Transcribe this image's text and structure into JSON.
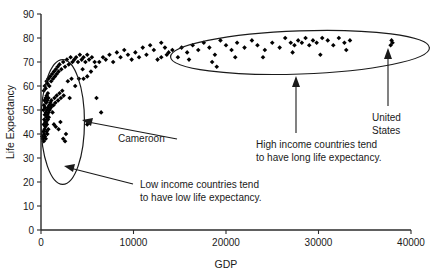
{
  "chart_data": {
    "type": "scatter",
    "title": "",
    "xlabel": "GDP",
    "ylabel": "Life Expectancy",
    "xlim": [
      0,
      40000
    ],
    "ylim": [
      0,
      90
    ],
    "grid": false,
    "legend": "none",
    "x_ticks": [
      "0",
      "10000",
      "20000",
      "30000",
      "40000"
    ],
    "x_tick_values": [
      0,
      10000,
      20000,
      30000,
      40000
    ],
    "y_ticks": [
      "0",
      "10",
      "20",
      "30",
      "40",
      "50",
      "60",
      "70",
      "80",
      "90"
    ],
    "y_tick_values": [
      0,
      10,
      20,
      30,
      40,
      50,
      60,
      70,
      80,
      90
    ],
    "marker_shape": "diamond",
    "marker_color": "#000000",
    "points": [
      [
        150,
        39
      ],
      [
        200,
        38
      ],
      [
        260,
        41
      ],
      [
        300,
        37
      ],
      [
        340,
        40
      ],
      [
        380,
        42
      ],
      [
        420,
        39
      ],
      [
        470,
        43
      ],
      [
        510,
        38
      ],
      [
        560,
        45
      ],
      [
        600,
        41
      ],
      [
        640,
        44
      ],
      [
        690,
        40
      ],
      [
        740,
        46
      ],
      [
        790,
        42
      ],
      [
        840,
        47
      ],
      [
        300,
        44
      ],
      [
        350,
        46
      ],
      [
        410,
        48
      ],
      [
        460,
        45
      ],
      [
        520,
        49
      ],
      [
        580,
        47
      ],
      [
        640,
        50
      ],
      [
        700,
        48
      ],
      [
        760,
        51
      ],
      [
        820,
        49
      ],
      [
        880,
        52
      ],
      [
        940,
        50
      ],
      [
        1000,
        53
      ],
      [
        1060,
        51
      ],
      [
        1120,
        54
      ],
      [
        1180,
        52
      ],
      [
        260,
        50
      ],
      [
        320,
        52
      ],
      [
        380,
        54
      ],
      [
        440,
        51
      ],
      [
        500,
        55
      ],
      [
        560,
        53
      ],
      [
        620,
        56
      ],
      [
        680,
        54
      ],
      [
        740,
        57
      ],
      [
        800,
        55
      ],
      [
        1250,
        49
      ],
      [
        1350,
        52
      ],
      [
        1450,
        55
      ],
      [
        1550,
        53
      ],
      [
        1700,
        56
      ],
      [
        1850,
        54
      ],
      [
        2000,
        57
      ],
      [
        2150,
        55
      ],
      [
        2300,
        58
      ],
      [
        2450,
        56
      ],
      [
        1400,
        44
      ],
      [
        1600,
        43
      ],
      [
        1900,
        42
      ],
      [
        2100,
        45
      ],
      [
        2400,
        38
      ],
      [
        2600,
        37
      ],
      [
        2700,
        40
      ],
      [
        300,
        58
      ],
      [
        400,
        60
      ],
      [
        500,
        59
      ],
      [
        600,
        62
      ],
      [
        700,
        61
      ],
      [
        800,
        63
      ],
      [
        900,
        60
      ],
      [
        1000,
        64
      ],
      [
        1100,
        62
      ],
      [
        1200,
        65
      ],
      [
        1300,
        63
      ],
      [
        1400,
        66
      ],
      [
        1500,
        64
      ],
      [
        1600,
        67
      ],
      [
        1700,
        65
      ],
      [
        1800,
        68
      ],
      [
        1900,
        66
      ],
      [
        2000,
        69
      ],
      [
        2200,
        67
      ],
      [
        2400,
        70
      ],
      [
        2600,
        68
      ],
      [
        2800,
        71
      ],
      [
        3000,
        69
      ],
      [
        3200,
        72
      ],
      [
        3400,
        70
      ],
      [
        3600,
        71
      ],
      [
        3800,
        72
      ],
      [
        4000,
        70
      ],
      [
        4200,
        73
      ],
      [
        4400,
        71
      ],
      [
        4600,
        72
      ],
      [
        4800,
        70
      ],
      [
        5000,
        73
      ],
      [
        5200,
        71
      ],
      [
        5500,
        72
      ],
      [
        5800,
        70
      ],
      [
        2900,
        62
      ],
      [
        3300,
        63
      ],
      [
        3700,
        60
      ],
      [
        4100,
        63
      ],
      [
        4500,
        67
      ],
      [
        5000,
        64
      ],
      [
        5400,
        66
      ],
      [
        5900,
        68
      ],
      [
        6300,
        70
      ],
      [
        6700,
        72
      ],
      [
        7000,
        71
      ],
      [
        7400,
        73
      ],
      [
        7800,
        70
      ],
      [
        8200,
        74
      ],
      [
        8600,
        72
      ],
      [
        9000,
        75
      ],
      [
        9400,
        73
      ],
      [
        9800,
        71
      ],
      [
        6000,
        55
      ],
      [
        6500,
        49
      ],
      [
        4600,
        63
      ],
      [
        3100,
        55
      ],
      [
        5000,
        44
      ],
      [
        10200,
        74
      ],
      [
        10600,
        72
      ],
      [
        11000,
        76
      ],
      [
        11400,
        73
      ],
      [
        11800,
        77
      ],
      [
        12200,
        75
      ],
      [
        12600,
        71
      ],
      [
        13000,
        78
      ],
      [
        13400,
        76
      ],
      [
        13800,
        74
      ],
      [
        13000,
        72
      ],
      [
        13600,
        73
      ],
      [
        14200,
        75
      ],
      [
        14800,
        72
      ],
      [
        15200,
        76
      ],
      [
        15800,
        74
      ],
      [
        16400,
        77
      ],
      [
        17000,
        75
      ],
      [
        17600,
        78
      ],
      [
        18200,
        76
      ],
      [
        18800,
        73
      ],
      [
        19400,
        79
      ],
      [
        20000,
        77
      ],
      [
        20600,
        75
      ],
      [
        21200,
        78
      ],
      [
        16000,
        71
      ],
      [
        18500,
        70
      ],
      [
        21000,
        72
      ],
      [
        22000,
        76
      ],
      [
        22800,
        79
      ],
      [
        23400,
        77
      ],
      [
        24200,
        75
      ],
      [
        25000,
        78
      ],
      [
        25800,
        76
      ],
      [
        26400,
        80
      ],
      [
        27000,
        78
      ],
      [
        27400,
        77
      ],
      [
        27800,
        79
      ],
      [
        28200,
        78
      ],
      [
        28600,
        80
      ],
      [
        29000,
        77
      ],
      [
        29400,
        79
      ],
      [
        29800,
        78
      ],
      [
        30400,
        80
      ],
      [
        31000,
        79
      ],
      [
        31600,
        77
      ],
      [
        32200,
        80
      ],
      [
        32800,
        78
      ],
      [
        33400,
        79
      ],
      [
        27200,
        74
      ],
      [
        30200,
        73
      ],
      [
        33000,
        75
      ],
      [
        24000,
        72
      ],
      [
        19000,
        68
      ],
      [
        37800,
        77
      ],
      [
        37900,
        79
      ],
      [
        38000,
        78
      ]
    ],
    "annotations": [
      {
        "name": "cameroon-annotation",
        "label": "Cameroon",
        "target_point": [
          1200,
          45
        ]
      },
      {
        "name": "low-income-annotation",
        "label_line1": "Low income countries tend",
        "label_line2": "to have low life expectancy.",
        "target": "low-income-ellipse"
      },
      {
        "name": "high-income-annotation",
        "label_line1": "High income countries tend",
        "label_line2": "to have long life expectancy.",
        "target": "high-income-ellipse"
      },
      {
        "name": "united-states-annotation",
        "label_line1": "United",
        "label_line2": "States",
        "target_point": [
          37900,
          78
        ]
      }
    ],
    "ellipses": [
      {
        "name": "low-income-ellipse",
        "center": [
          2350,
          45
        ],
        "x_radius": 2350,
        "y_radius": 26,
        "rotation_deg": 0
      },
      {
        "name": "high-income-ellipse",
        "center": [
          28000,
          74
        ],
        "x_radius": 14000,
        "y_radius": 9,
        "rotation_deg": -2
      }
    ]
  }
}
